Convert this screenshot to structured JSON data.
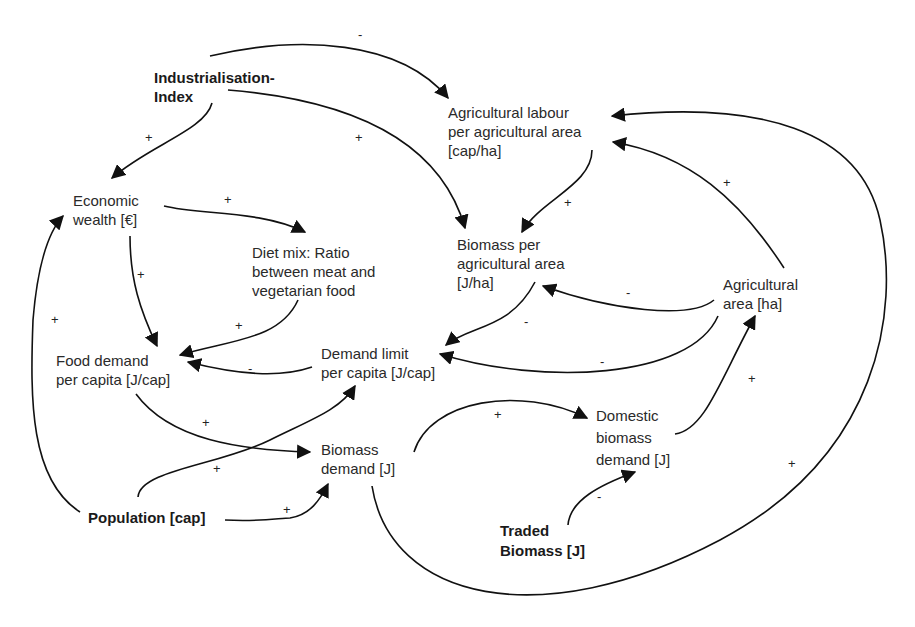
{
  "diagram": {
    "type": "causal-loop-diagram",
    "nodes": [
      {
        "id": "industrialisation",
        "lines": [
          "Industrialisation-",
          "Index"
        ],
        "bold": true
      },
      {
        "id": "agri_labour",
        "lines": [
          "Agricultural labour",
          "per agricultural area",
          "[cap/ha]"
        ],
        "bold": false
      },
      {
        "id": "economic_wealth",
        "lines": [
          "Economic",
          "wealth [€]"
        ],
        "bold": false
      },
      {
        "id": "diet_mix",
        "lines": [
          "Diet mix: Ratio",
          "between meat and",
          "vegetarian food"
        ],
        "bold": false
      },
      {
        "id": "biomass_per_area",
        "lines": [
          "Biomass per",
          "agricultural area",
          "[J/ha]"
        ],
        "bold": false
      },
      {
        "id": "agri_area",
        "lines": [
          "Agricultural",
          "area [ha]"
        ],
        "bold": false
      },
      {
        "id": "food_demand",
        "lines": [
          "Food demand",
          "per capita [J/cap]"
        ],
        "bold": false
      },
      {
        "id": "demand_limit",
        "lines": [
          "Demand limit",
          "per capita [J/cap]"
        ],
        "bold": false
      },
      {
        "id": "biomass_demand",
        "lines": [
          "Biomass",
          "demand [J]"
        ],
        "bold": false
      },
      {
        "id": "domestic_biomass",
        "lines": [
          "Domestic",
          "biomass",
          "demand [J]"
        ],
        "bold": false
      },
      {
        "id": "population",
        "lines": [
          "Population [cap]"
        ],
        "bold": true
      },
      {
        "id": "traded_biomass",
        "lines": [
          "Traded",
          "Biomass [J]"
        ],
        "bold": true
      }
    ],
    "edges": [
      {
        "from": "industrialisation",
        "to": "agri_labour",
        "sign": "-"
      },
      {
        "from": "industrialisation",
        "to": "economic_wealth",
        "sign": "+"
      },
      {
        "from": "industrialisation",
        "to": "biomass_per_area",
        "sign": "+"
      },
      {
        "from": "agri_labour",
        "to": "biomass_per_area",
        "sign": "+"
      },
      {
        "from": "agri_area",
        "to": "agri_labour",
        "sign": "+"
      },
      {
        "from": "biomass_demand",
        "to": "agri_labour",
        "sign": "+"
      },
      {
        "from": "economic_wealth",
        "to": "diet_mix",
        "sign": "+"
      },
      {
        "from": "economic_wealth",
        "to": "food_demand",
        "sign": "+"
      },
      {
        "from": "diet_mix",
        "to": "food_demand",
        "sign": "+"
      },
      {
        "from": "agri_area",
        "to": "biomass_per_area",
        "sign": "-"
      },
      {
        "from": "biomass_per_area",
        "to": "demand_limit",
        "sign": "-"
      },
      {
        "from": "agri_area",
        "to": "demand_limit",
        "sign": "-"
      },
      {
        "from": "demand_limit",
        "to": "food_demand",
        "sign": "-"
      },
      {
        "from": "population",
        "to": "economic_wealth",
        "sign": "+"
      },
      {
        "from": "food_demand",
        "to": "biomass_demand",
        "sign": "+"
      },
      {
        "from": "population",
        "to": "demand_limit",
        "sign": "+"
      },
      {
        "from": "population",
        "to": "biomass_demand",
        "sign": "+"
      },
      {
        "from": "biomass_demand",
        "to": "domestic_biomass",
        "sign": "+"
      },
      {
        "from": "domestic_biomass",
        "to": "agri_area",
        "sign": "+"
      },
      {
        "from": "traded_biomass",
        "to": "domestic_biomass",
        "sign": "-"
      }
    ]
  },
  "labels": {
    "industrialisation": [
      "Industrialisation-",
      "Index"
    ],
    "agri_labour": [
      "Agricultural labour",
      "per agricultural area",
      "[cap/ha]"
    ],
    "economic_wealth": [
      "Economic",
      "wealth [€]"
    ],
    "diet_mix": [
      "Diet mix: Ratio",
      "between meat and",
      "vegetarian food"
    ],
    "biomass_per_area": [
      "Biomass per",
      "agricultural area",
      "[J/ha]"
    ],
    "agri_area": [
      "Agricultural",
      "area [ha]"
    ],
    "food_demand": [
      "Food demand",
      "per capita [J/cap]"
    ],
    "demand_limit": [
      "Demand limit",
      "per capita [J/cap]"
    ],
    "biomass_demand": [
      "Biomass",
      "demand [J]"
    ],
    "domestic_biomass": [
      "Domestic",
      "biomass",
      "demand [J]"
    ],
    "population": [
      "Population [cap]"
    ],
    "traded_biomass": [
      "Traded",
      "Biomass [J]"
    ]
  },
  "signs": [
    "-",
    "+",
    "+",
    "+",
    "+",
    "+",
    "+",
    "+",
    "+",
    "-",
    "-",
    "-",
    "-",
    "+",
    "+",
    "+",
    "+",
    "+",
    "+",
    "-"
  ]
}
